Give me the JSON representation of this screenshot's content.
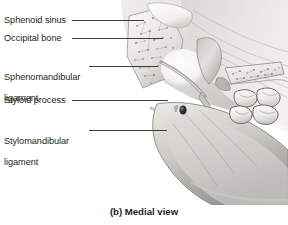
{
  "figure": {
    "caption": "(b) Medial view",
    "view_type": "Medial view",
    "panel_letter": "(b)",
    "colors": {
      "background": "#ffffff",
      "text": "#231f20",
      "leader_line": "#3c3c3c",
      "bone_light": "#f2f1ee",
      "bone_mid": "#cfcdc8",
      "bone_shadow": "#8e8c88",
      "tissue_light": "#e6e4e0",
      "tissue_mid": "#bfbdb8",
      "tissue_dark": "#8a8884",
      "foramen_dark": "#2b2b2b"
    }
  },
  "labels": [
    {
      "id": "sphenoid-sinus",
      "text": "Sphenoid sinus",
      "lines": [
        "Sphenoid sinus"
      ],
      "y": 20,
      "text_left": 4,
      "leader_x1": 72,
      "leader_x2": 144
    },
    {
      "id": "occipital-bone",
      "text": "Occipital bone",
      "lines": [
        "Occipital bone"
      ],
      "y": 38,
      "text_left": 4,
      "leader_x1": 72,
      "leader_x2": 163
    },
    {
      "id": "sphenomandibular-ligament",
      "text": "Sphenomandibular ligament",
      "lines": [
        "Sphenomandibular",
        "ligament"
      ],
      "y": 66,
      "text_left": 4,
      "leader_x1": 89,
      "leader_x2": 158
    },
    {
      "id": "styloid-process",
      "text": "Styloid process",
      "lines": [
        "Styloid process"
      ],
      "y": 100,
      "text_left": 4,
      "leader_x1": 72,
      "leader_x2": 168
    },
    {
      "id": "stylomandibular-ligament",
      "text": "Stylomandibular ligament",
      "lines": [
        "Stylomandibular",
        "ligament"
      ],
      "y": 130,
      "text_left": 4,
      "leader_x1": 89,
      "leader_x2": 167
    }
  ],
  "anatomy_features": [
    {
      "id": "sphenoid-sinus-cavity",
      "name": "sphenoid sinus cavity",
      "type": "air-space"
    },
    {
      "id": "occipital-bone-body",
      "name": "occipital bone with trabeculae",
      "type": "cancellous-bone"
    },
    {
      "id": "sphenomandibular-lig",
      "name": "sphenomandibular ligament",
      "type": "ligament"
    },
    {
      "id": "styloid-process-spine",
      "name": "styloid process",
      "type": "bone-process"
    },
    {
      "id": "stylomandibular-lig",
      "name": "stylomandibular ligament",
      "type": "ligament"
    },
    {
      "id": "mandibular-foramen",
      "name": "mandibular foramen",
      "type": "foramen"
    },
    {
      "id": "mandible-ramus",
      "name": "ramus of mandible",
      "type": "bone"
    },
    {
      "id": "molar-teeth",
      "name": "molar teeth",
      "type": "teeth",
      "count": 4
    },
    {
      "id": "hard-palate",
      "name": "hard palate / pterygoid plate",
      "type": "cancellous-bone"
    }
  ]
}
